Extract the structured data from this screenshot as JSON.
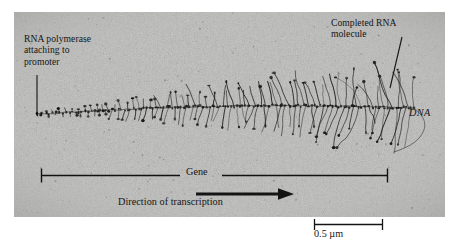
{
  "figure": {
    "kind": "electron-micrograph",
    "plate": {
      "background_color": "#b9b9b7",
      "grain_color": "#8f8f8d",
      "strand_color": "#1d1d1d"
    }
  },
  "annotations": {
    "polymerase": {
      "line1": "RNA polymerase",
      "line2": "attaching to",
      "line3": "promoter"
    },
    "completed_rna": {
      "line1": "Completed RNA",
      "line2": "molecule"
    },
    "dna_label": "DNA",
    "gene_label": "Gene",
    "direction_label": "Direction of transcription",
    "scale_label": "0.5 µm"
  },
  "colors": {
    "ink": "#151515",
    "rule": "#121212",
    "page": "#ffffff"
  },
  "chart_data": {
    "type": "scatter",
    "xlabel": "position along gene",
    "ylabel": "nascent RNA transcript length",
    "annotations": [
      "RNA polymerase attaching to promoter",
      "Completed RNA molecule",
      "DNA",
      "Gene",
      "Direction of transcription",
      "0.5 µm"
    ],
    "scale_bar": {
      "label": "0.5 µm",
      "length_px": 69
    },
    "gene_bracket": {
      "left_px": 41,
      "right_px": 388,
      "label": "Gene"
    },
    "transcription_arrow": {
      "from_px": 196,
      "to_px": 292,
      "direction": "right"
    }
  }
}
